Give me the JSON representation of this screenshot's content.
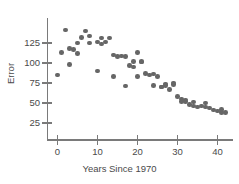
{
  "chart_data": {
    "type": "scatter",
    "title": "",
    "xlabel": "Years Since 1970",
    "ylabel": "Error",
    "xlim": [
      -2,
      44
    ],
    "ylim": [
      18,
      148
    ],
    "grid": false,
    "legend": null,
    "point_color": "#666666",
    "axis_color": "#7a7a7a",
    "xticks": [
      0,
      10,
      20,
      30,
      40
    ],
    "xtick_labels": [
      "0",
      "10",
      "20",
      "30",
      "40"
    ],
    "yticks": [
      25,
      50,
      75,
      100,
      125
    ],
    "ytick_labels": [
      "25",
      "50",
      "75",
      "100",
      "125"
    ],
    "x": [
      0,
      1,
      2,
      3,
      3,
      4,
      5,
      5,
      6,
      7,
      8,
      8,
      10,
      10,
      11,
      11,
      12,
      13,
      14,
      14,
      15,
      16,
      17,
      17,
      18,
      19,
      19,
      20,
      20,
      21,
      21,
      22,
      23,
      24,
      24,
      25,
      26,
      26,
      27,
      27,
      28,
      29,
      29,
      30,
      31,
      31,
      32,
      32,
      33,
      34,
      34,
      35,
      36,
      37,
      37,
      38,
      39,
      40,
      41,
      41,
      42
    ],
    "y": [
      85,
      113,
      141,
      118,
      98,
      117,
      125,
      112,
      132,
      140,
      134,
      125,
      90,
      126,
      124,
      131,
      126,
      131,
      83,
      110,
      108,
      109,
      71,
      108,
      97,
      102,
      95,
      113,
      83,
      102,
      101,
      87,
      85,
      86,
      72,
      83,
      70,
      70,
      74,
      72,
      67,
      75,
      73,
      58,
      55,
      52,
      54,
      52,
      48,
      46,
      51,
      45,
      46,
      45,
      50,
      44,
      41,
      40,
      38,
      42,
      38
    ],
    "n_points": 61
  }
}
